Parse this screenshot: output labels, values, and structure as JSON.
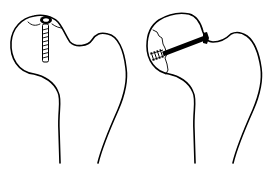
{
  "figure": {
    "panels": [
      {
        "id": "left",
        "subject": "proximal femur",
        "implant": "screw inserted vertically through femoral head (countersunk head at top)",
        "stroke_color": "#000000"
      },
      {
        "id": "right",
        "subject": "proximal femur with fractured femoral head",
        "implant": "screw inserted obliquely from neck through fracture line into head",
        "stroke_color": "#000000"
      }
    ],
    "background": "#ffffff"
  }
}
